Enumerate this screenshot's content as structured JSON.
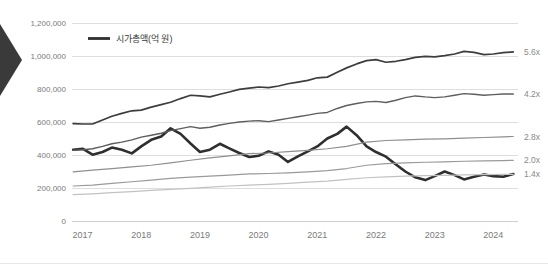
{
  "nav": {
    "arrow_icon": "chevron-left-icon",
    "arrow_color": "#3a3a3a"
  },
  "legend": {
    "label": "시가총액(억 원)",
    "swatch_color": "#2f2f2f",
    "position": "top-left-inside"
  },
  "colors": {
    "main_series": "#2f2f2f",
    "line_5_6x": "#3d3d3d",
    "line_4_2x": "#5e5e5e",
    "line_2_8x": "#8f8f8f",
    "line_2_0x": "#9a9a9a",
    "line_1_4x": "#c2c2c2",
    "line_bottom": "#dcdcdc",
    "grid": "#dedede",
    "tick_text": "#7a7a7a",
    "right_label_text": "#8a8a8a"
  },
  "chart_data": {
    "type": "line",
    "title": "",
    "subtitle": "",
    "xlabel": "",
    "ylabel": "",
    "ylim": [
      0,
      1200000
    ],
    "yticks": [
      0,
      200000,
      400000,
      600000,
      800000,
      1000000,
      1200000
    ],
    "ytick_labels": [
      "0",
      "200,000",
      "400,000",
      "600,000",
      "800,000",
      "1,000,000",
      "1,200,000"
    ],
    "categories": [
      "2017",
      "2018",
      "2019",
      "2020",
      "2021",
      "2022",
      "2023",
      "2024"
    ],
    "xticks": [
      "2017",
      "2018",
      "2019",
      "2020",
      "2021",
      "2022",
      "2023",
      "2024"
    ],
    "grid": true,
    "grid_axis": "y",
    "legend_entries": [
      "시가총액(억 원)"
    ],
    "right_annotations": [
      {
        "label": "5.6x",
        "value": 1025000
      },
      {
        "label": "4.2x",
        "value": 770000
      },
      {
        "label": "2.8x",
        "value": 512000
      },
      {
        "label": "2.0x",
        "value": 368000
      },
      {
        "label": "1.4x",
        "value": 283000
      }
    ],
    "x_range": [
      2016.9,
      2024.5
    ],
    "series": [
      {
        "name": "시가총액(억 원)",
        "emphasis": "bold",
        "color": "#2f2f2f",
        "width": 2.6,
        "x": [
          2016.92,
          2017.08,
          2017.25,
          2017.42,
          2017.58,
          2017.75,
          2017.92,
          2018.08,
          2018.25,
          2018.42,
          2018.58,
          2018.75,
          2018.92,
          2019.08,
          2019.25,
          2019.42,
          2019.58,
          2019.75,
          2019.92,
          2020.08,
          2020.25,
          2020.42,
          2020.58,
          2020.75,
          2020.92,
          2021.08,
          2021.25,
          2021.42,
          2021.58,
          2021.75,
          2021.92,
          2022.08,
          2022.25,
          2022.42,
          2022.58,
          2022.75,
          2022.92,
          2023.08,
          2023.25,
          2023.42,
          2023.58,
          2023.75,
          2023.92,
          2024.08,
          2024.25,
          2024.42
        ],
        "values": [
          432000,
          438000,
          402000,
          418000,
          445000,
          432000,
          410000,
          452000,
          492000,
          512000,
          562000,
          528000,
          470000,
          418000,
          432000,
          468000,
          440000,
          412000,
          388000,
          395000,
          422000,
          402000,
          358000,
          392000,
          422000,
          452000,
          500000,
          528000,
          572000,
          520000,
          452000,
          418000,
          390000,
          342000,
          300000,
          265000,
          248000,
          272000,
          300000,
          278000,
          252000,
          268000,
          282000,
          272000,
          268000,
          285000
        ]
      },
      {
        "name": "5.6x",
        "emphasis": "normal",
        "color": "#3d3d3d",
        "width": 1.7,
        "x": [
          2016.92,
          2017.08,
          2017.25,
          2017.42,
          2017.58,
          2017.75,
          2017.92,
          2018.08,
          2018.25,
          2018.42,
          2018.58,
          2018.75,
          2018.92,
          2019.08,
          2019.25,
          2019.42,
          2019.58,
          2019.75,
          2019.92,
          2020.08,
          2020.25,
          2020.42,
          2020.58,
          2020.75,
          2020.92,
          2021.08,
          2021.25,
          2021.42,
          2021.58,
          2021.75,
          2021.92,
          2022.08,
          2022.25,
          2022.42,
          2022.58,
          2022.75,
          2022.92,
          2023.08,
          2023.25,
          2023.42,
          2023.58,
          2023.75,
          2023.92,
          2024.08,
          2024.25,
          2024.42
        ],
        "values": [
          590000,
          588000,
          588000,
          612000,
          635000,
          652000,
          668000,
          672000,
          690000,
          705000,
          720000,
          742000,
          762000,
          758000,
          752000,
          768000,
          782000,
          798000,
          805000,
          812000,
          808000,
          818000,
          832000,
          842000,
          852000,
          868000,
          872000,
          902000,
          928000,
          952000,
          972000,
          978000,
          962000,
          968000,
          978000,
          992000,
          998000,
          995000,
          1002000,
          1012000,
          1028000,
          1022000,
          1008000,
          1012000,
          1020000,
          1025000
        ]
      },
      {
        "name": "4.2x",
        "emphasis": "normal",
        "color": "#5e5e5e",
        "width": 1.4,
        "x": [
          2016.92,
          2017.08,
          2017.25,
          2017.42,
          2017.58,
          2017.75,
          2017.92,
          2018.08,
          2018.25,
          2018.42,
          2018.58,
          2018.75,
          2018.92,
          2019.08,
          2019.25,
          2019.42,
          2019.58,
          2019.75,
          2019.92,
          2020.08,
          2020.25,
          2020.42,
          2020.58,
          2020.75,
          2020.92,
          2021.08,
          2021.25,
          2021.42,
          2021.58,
          2021.75,
          2021.92,
          2022.08,
          2022.25,
          2022.42,
          2022.58,
          2022.75,
          2022.92,
          2023.08,
          2023.25,
          2023.42,
          2023.58,
          2023.75,
          2023.92,
          2024.08,
          2024.25,
          2024.42
        ],
        "values": [
          428000,
          432000,
          438000,
          452000,
          468000,
          478000,
          492000,
          508000,
          520000,
          532000,
          548000,
          560000,
          572000,
          562000,
          568000,
          582000,
          592000,
          600000,
          605000,
          608000,
          602000,
          612000,
          622000,
          632000,
          642000,
          652000,
          658000,
          682000,
          700000,
          712000,
          722000,
          725000,
          718000,
          732000,
          748000,
          758000,
          752000,
          748000,
          752000,
          762000,
          772000,
          768000,
          762000,
          766000,
          770000,
          770000
        ]
      },
      {
        "name": "2.8x",
        "emphasis": "normal",
        "color": "#8f8f8f",
        "width": 1.2,
        "x": [
          2016.92,
          2017.25,
          2017.58,
          2017.92,
          2018.25,
          2018.58,
          2018.92,
          2019.25,
          2019.58,
          2019.92,
          2020.25,
          2020.58,
          2020.92,
          2021.25,
          2021.58,
          2021.92,
          2022.25,
          2022.58,
          2022.92,
          2023.25,
          2023.58,
          2023.92,
          2024.25,
          2024.42
        ],
        "values": [
          298000,
          308000,
          318000,
          328000,
          338000,
          352000,
          368000,
          382000,
          395000,
          408000,
          412000,
          420000,
          428000,
          438000,
          452000,
          478000,
          488000,
          492000,
          496000,
          498000,
          502000,
          506000,
          510000,
          512000
        ]
      },
      {
        "name": "2.0x",
        "emphasis": "normal",
        "color": "#9a9a9a",
        "width": 1.2,
        "x": [
          2016.92,
          2017.25,
          2017.58,
          2017.92,
          2018.25,
          2018.58,
          2018.92,
          2019.25,
          2019.58,
          2019.92,
          2020.25,
          2020.58,
          2020.92,
          2021.25,
          2021.58,
          2021.92,
          2022.25,
          2022.58,
          2022.92,
          2023.25,
          2023.58,
          2023.92,
          2024.25,
          2024.42
        ],
        "values": [
          212000,
          218000,
          228000,
          238000,
          248000,
          258000,
          266000,
          272000,
          278000,
          285000,
          288000,
          292000,
          298000,
          305000,
          318000,
          338000,
          348000,
          352000,
          356000,
          358000,
          362000,
          364000,
          366000,
          368000
        ]
      },
      {
        "name": "1.4x",
        "emphasis": "normal",
        "color": "#c2c2c2",
        "width": 1.2,
        "x": [
          2016.92,
          2017.25,
          2017.58,
          2017.92,
          2018.25,
          2018.58,
          2018.92,
          2019.25,
          2019.58,
          2019.92,
          2020.25,
          2020.58,
          2020.92,
          2021.25,
          2021.58,
          2021.92,
          2022.25,
          2022.58,
          2022.92,
          2023.25,
          2023.58,
          2023.92,
          2024.25,
          2024.42
        ],
        "values": [
          160000,
          165000,
          172000,
          178000,
          185000,
          192000,
          198000,
          205000,
          212000,
          218000,
          222000,
          228000,
          235000,
          242000,
          252000,
          262000,
          268000,
          272000,
          275000,
          277000,
          279000,
          281000,
          282000,
          283000
        ]
      }
    ]
  }
}
